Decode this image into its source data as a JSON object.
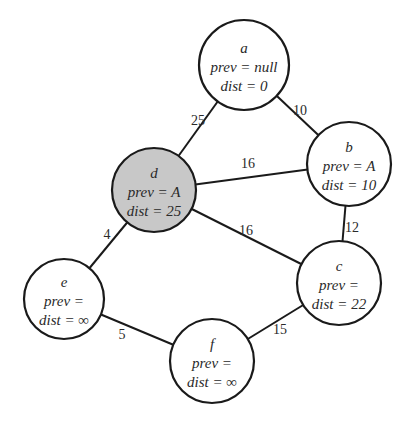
{
  "graph": {
    "colors": {
      "stroke": "#1a1a1a",
      "node_fill": "#ffffff",
      "highlight_fill": "#c8c8c8",
      "text": "#2a2a2a"
    },
    "nodes": [
      {
        "id": "a",
        "name": "a",
        "prev": "prev = null",
        "dist": "dist = 0",
        "cx": 244,
        "cy": 65,
        "r": 45,
        "highlighted": false
      },
      {
        "id": "b",
        "name": "b",
        "prev": "prev = A",
        "dist": "dist = 10",
        "cx": 349,
        "cy": 164,
        "r": 42,
        "highlighted": false
      },
      {
        "id": "c",
        "name": "c",
        "prev": "prev =",
        "dist": "dist = 22",
        "cx": 339,
        "cy": 283,
        "r": 42,
        "highlighted": false
      },
      {
        "id": "d",
        "name": "d",
        "prev": "prev = A",
        "dist": "dist = 25",
        "cx": 154,
        "cy": 190,
        "r": 42,
        "highlighted": true
      },
      {
        "id": "e",
        "name": "e",
        "prev": "prev =",
        "dist": "dist = ∞",
        "cx": 64,
        "cy": 299,
        "r": 40,
        "highlighted": false
      },
      {
        "id": "f",
        "name": "f",
        "prev": "prev =",
        "dist": "dist = ∞",
        "cx": 212,
        "cy": 361,
        "r": 42,
        "highlighted": false
      }
    ],
    "edges": [
      {
        "from": "a",
        "to": "d",
        "weight": "25",
        "lx": 198,
        "ly": 125
      },
      {
        "from": "a",
        "to": "b",
        "weight": "10",
        "lx": 300,
        "ly": 115
      },
      {
        "from": "d",
        "to": "b",
        "weight": "16",
        "lx": 248,
        "ly": 168
      },
      {
        "from": "d",
        "to": "c",
        "weight": "16",
        "lx": 246,
        "ly": 235
      },
      {
        "from": "b",
        "to": "c",
        "weight": "12",
        "lx": 352,
        "ly": 232
      },
      {
        "from": "d",
        "to": "e",
        "weight": "4",
        "lx": 107,
        "ly": 239
      },
      {
        "from": "e",
        "to": "f",
        "weight": "5",
        "lx": 122,
        "ly": 339
      },
      {
        "from": "f",
        "to": "c",
        "weight": "15",
        "lx": 280,
        "ly": 334
      }
    ]
  }
}
